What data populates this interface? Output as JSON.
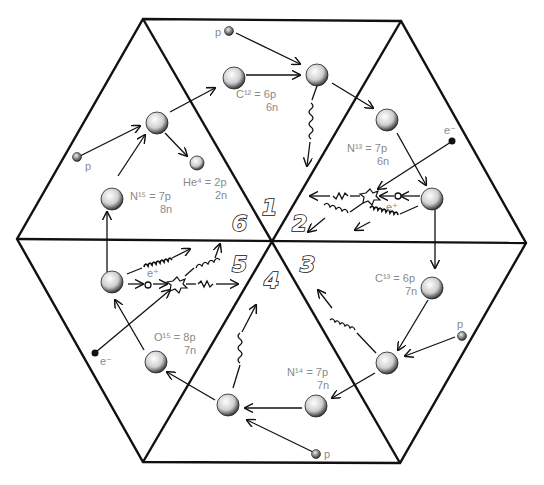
{
  "diagram": {
    "sections": [
      {
        "number": "1",
        "nucleus": "C¹² = 6p",
        "neutrons": "6n"
      },
      {
        "number": "2",
        "nucleus": "N¹³ = 7p",
        "neutrons": "6n"
      },
      {
        "number": "3",
        "nucleus": "C¹³ = 6p",
        "neutrons": "7n"
      },
      {
        "number": "4",
        "nucleus": "N¹⁴ = 7p",
        "neutrons": "7n"
      },
      {
        "number": "5",
        "nucleus": "O¹⁵ = 8p",
        "neutrons": "7n"
      },
      {
        "number": "6",
        "nucleus": "N¹⁵ = 7p",
        "neutrons": "8n"
      }
    ],
    "helium": {
      "nucleus": "He⁴ = 2p",
      "neutrons": "2n"
    },
    "particles": {
      "proton": "p",
      "electron": "e⁻",
      "positron": "e⁺"
    },
    "colors": {
      "line": "#111111",
      "label": "#8a8a8a",
      "background": "#ffffff"
    }
  }
}
